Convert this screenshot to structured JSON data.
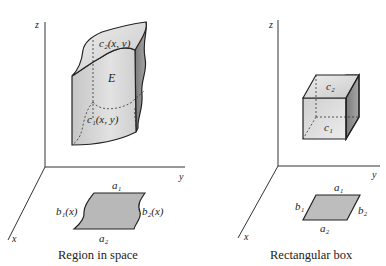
{
  "left_panel": {
    "caption": "Region in space",
    "axes": {
      "z": "z",
      "y": "y",
      "x": "x"
    },
    "solid": {
      "label": "E",
      "top_surface": "c₂(x, y)",
      "bottom_surface": "c₁(x, y)"
    },
    "base_region": {
      "top_edge": "a₁",
      "bottom_edge": "a₂",
      "left_edge": "b₁(x)",
      "right_edge": "b₂(x)"
    }
  },
  "right_panel": {
    "caption": "Rectangular box",
    "axes": {
      "z": "z",
      "y": "y",
      "x": "x"
    },
    "solid": {
      "top_face": "c₂",
      "bottom_face": "c₁"
    },
    "base_region": {
      "top_edge": "a₁",
      "bottom_edge": "a₂",
      "left_edge": "b₁",
      "right_edge": "b₂"
    }
  },
  "colors": {
    "ink": "#222222",
    "light_fill": "#d8d8d8",
    "mid_fill": "#b4b4b4",
    "dark_fill": "#8a8a8a"
  }
}
